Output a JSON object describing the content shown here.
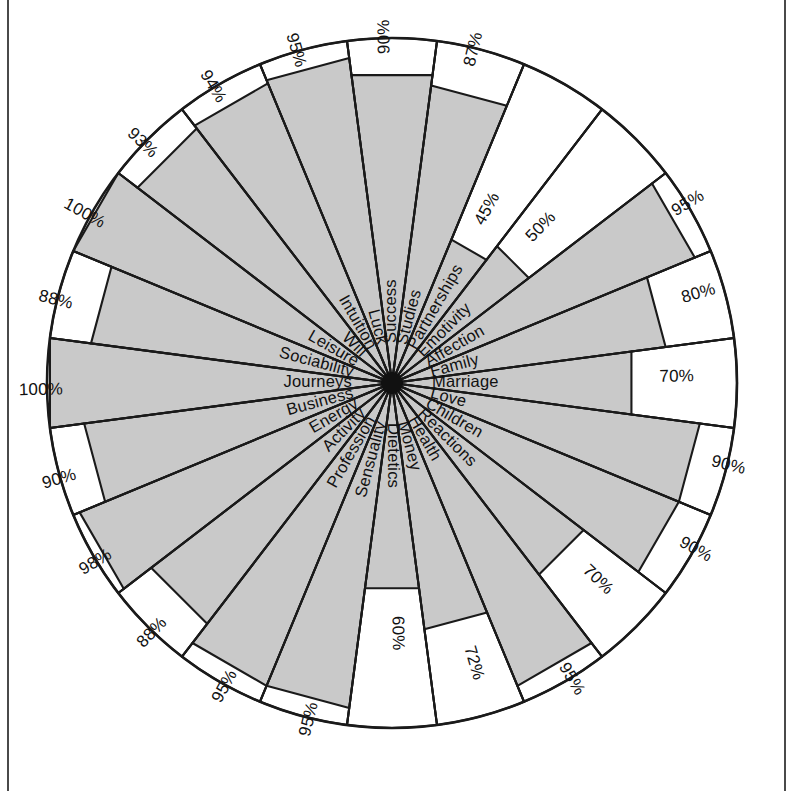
{
  "chart_data": {
    "type": "pie",
    "title": "",
    "subtitle": "",
    "xlabel": "",
    "ylabel": "",
    "value_suffix": "%",
    "value_min": 0,
    "value_max": 100,
    "grid": false,
    "legend": "none",
    "sector_count": 24,
    "reading_order": "clockwise from top (12 o'clock)",
    "colors": {
      "filled": "#c9c9c9",
      "unfilled": "#ffffff",
      "outline": "#1a1a1a",
      "hub": "#111111"
    },
    "categories": [
      "Success",
      "Studies",
      "Partnerships",
      "Emotivity",
      "Affection",
      "Family",
      "Marriage",
      "Love",
      "Children",
      "Reactions",
      "Health",
      "Money",
      "Dietetics",
      "Sensuality",
      "Profession",
      "Activity",
      "Energy",
      "Business",
      "Journeys",
      "Sociability",
      "Leisure",
      "Will",
      "Intuition",
      "Luck"
    ],
    "values": [
      90,
      87,
      45,
      50,
      95,
      80,
      70,
      90,
      90,
      70,
      95,
      72,
      60,
      95,
      95,
      88,
      98,
      90,
      100,
      88,
      100,
      93,
      94,
      95
    ],
    "value_labels": [
      "90%",
      "87%",
      "45%",
      "50%",
      "95%",
      "80%",
      "70%",
      "90%",
      "90%",
      "70%",
      "95%",
      "72%",
      "60%",
      "95%",
      "95%",
      "88%",
      "98%",
      "90%",
      "100%",
      "88%",
      "100%",
      "93%",
      "94%",
      "95%"
    ],
    "sectors": [
      {
        "label": "Success",
        "value": 90,
        "value_label": "90%"
      },
      {
        "label": "Studies",
        "value": 87,
        "value_label": "87%"
      },
      {
        "label": "Partnerships",
        "value": 45,
        "value_label": "45%"
      },
      {
        "label": "Emotivity",
        "value": 50,
        "value_label": "50%"
      },
      {
        "label": "Affection",
        "value": 95,
        "value_label": "95%"
      },
      {
        "label": "Family",
        "value": 80,
        "value_label": "80%"
      },
      {
        "label": "Marriage",
        "value": 70,
        "value_label": "70%"
      },
      {
        "label": "Love",
        "value": 90,
        "value_label": "90%"
      },
      {
        "label": "Children",
        "value": 90,
        "value_label": "90%"
      },
      {
        "label": "Reactions",
        "value": 70,
        "value_label": "70%"
      },
      {
        "label": "Health",
        "value": 95,
        "value_label": "95%"
      },
      {
        "label": "Money",
        "value": 72,
        "value_label": "72%"
      },
      {
        "label": "Dietetics",
        "value": 60,
        "value_label": "60%"
      },
      {
        "label": "Sensuality",
        "value": 95,
        "value_label": "95%"
      },
      {
        "label": "Profession",
        "value": 95,
        "value_label": "95%"
      },
      {
        "label": "Activity",
        "value": 88,
        "value_label": "88%"
      },
      {
        "label": "Energy",
        "value": 98,
        "value_label": "98%"
      },
      {
        "label": "Business",
        "value": 90,
        "value_label": "90%"
      },
      {
        "label": "Journeys",
        "value": 100,
        "value_label": "100%"
      },
      {
        "label": "Sociability",
        "value": 88,
        "value_label": "88%"
      },
      {
        "label": "Leisure",
        "value": 100,
        "value_label": "100%"
      },
      {
        "label": "Will",
        "value": 93,
        "value_label": "93%"
      },
      {
        "label": "Intuition",
        "value": 94,
        "value_label": "94%"
      },
      {
        "label": "Luck",
        "value": 95,
        "value_label": "95%"
      }
    ]
  },
  "geometry": {
    "center_x": 392,
    "center_y": 383,
    "radius": 345,
    "hub_radius": 11,
    "label_inner_offset": 40
  }
}
